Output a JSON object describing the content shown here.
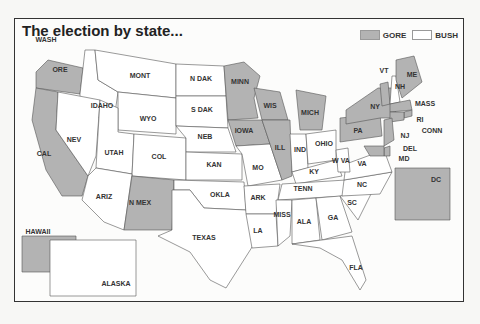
{
  "title": "The election by state...",
  "legend": [
    {
      "label": "GORE",
      "color": "#b3b3b3"
    },
    {
      "label": "BUSH",
      "color": "#ffffff"
    }
  ],
  "colors": {
    "gore": "#b3b3b3",
    "bush": "#ffffff",
    "border": "#555555"
  },
  "states": [
    {
      "name": "WASH",
      "winner": "gore"
    },
    {
      "name": "ORE",
      "winner": "gore"
    },
    {
      "name": "CAL",
      "winner": "gore"
    },
    {
      "name": "IDAHO",
      "winner": "bush"
    },
    {
      "name": "NEV",
      "winner": "bush"
    },
    {
      "name": "MONT",
      "winner": "bush"
    },
    {
      "name": "WYO",
      "winner": "bush"
    },
    {
      "name": "UTAH",
      "winner": "bush"
    },
    {
      "name": "COL",
      "winner": "bush"
    },
    {
      "name": "ARIZ",
      "winner": "bush"
    },
    {
      "name": "N MEX",
      "winner": "gore"
    },
    {
      "name": "N DAK",
      "winner": "bush"
    },
    {
      "name": "S DAK",
      "winner": "bush"
    },
    {
      "name": "NEB",
      "winner": "bush"
    },
    {
      "name": "KAN",
      "winner": "bush"
    },
    {
      "name": "OKLA",
      "winner": "bush"
    },
    {
      "name": "TEXAS",
      "winner": "bush"
    },
    {
      "name": "MINN",
      "winner": "gore"
    },
    {
      "name": "IOWA",
      "winner": "gore"
    },
    {
      "name": "MO",
      "winner": "bush"
    },
    {
      "name": "ARK",
      "winner": "bush"
    },
    {
      "name": "LA",
      "winner": "bush"
    },
    {
      "name": "WIS",
      "winner": "gore"
    },
    {
      "name": "ILL",
      "winner": "gore"
    },
    {
      "name": "MICH",
      "winner": "gore"
    },
    {
      "name": "IND",
      "winner": "bush"
    },
    {
      "name": "OHIO",
      "winner": "bush"
    },
    {
      "name": "KY",
      "winner": "bush"
    },
    {
      "name": "TENN",
      "winner": "bush"
    },
    {
      "name": "MISS",
      "winner": "bush"
    },
    {
      "name": "ALA",
      "winner": "bush"
    },
    {
      "name": "GA",
      "winner": "bush"
    },
    {
      "name": "FLA",
      "winner": "bush"
    },
    {
      "name": "SC",
      "winner": "bush"
    },
    {
      "name": "NC",
      "winner": "bush"
    },
    {
      "name": "VA",
      "winner": "bush"
    },
    {
      "name": "W VA",
      "winner": "bush"
    },
    {
      "name": "PA",
      "winner": "gore"
    },
    {
      "name": "NY",
      "winner": "gore"
    },
    {
      "name": "VT",
      "winner": "gore"
    },
    {
      "name": "NH",
      "winner": "bush"
    },
    {
      "name": "ME",
      "winner": "gore"
    },
    {
      "name": "MASS",
      "winner": "gore"
    },
    {
      "name": "RI",
      "winner": "gore"
    },
    {
      "name": "CONN",
      "winner": "gore"
    },
    {
      "name": "NJ",
      "winner": "gore"
    },
    {
      "name": "DEL",
      "winner": "gore"
    },
    {
      "name": "MD",
      "winner": "gore"
    },
    {
      "name": "DC",
      "winner": "gore"
    },
    {
      "name": "HAWAII",
      "winner": "gore"
    },
    {
      "name": "ALASKA",
      "winner": "bush"
    }
  ]
}
